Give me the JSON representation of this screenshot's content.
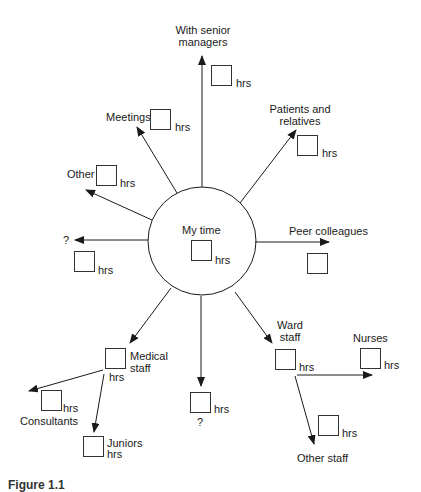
{
  "diagram": {
    "center": {
      "label": "My time",
      "unit": "hrs"
    },
    "unit": "hrs",
    "question_mark": "?",
    "branches": {
      "senior_managers": {
        "label_line1": "With senior",
        "label_line2": "managers",
        "unit": "hrs"
      },
      "meetings": {
        "label": "Meetings",
        "unit": "hrs"
      },
      "patients": {
        "label_line1": "Patients and",
        "label_line2": "relatives",
        "unit": "hrs"
      },
      "other": {
        "label": "Other",
        "unit": "hrs"
      },
      "unknown_left": {
        "label": "?",
        "unit": "hrs"
      },
      "peer": {
        "label": "Peer colleagues"
      },
      "medical_staff": {
        "label_line1": "Medical",
        "label_line2": "staff",
        "unit": "hrs"
      },
      "consultants": {
        "label": "Consultants",
        "unit": "hrs"
      },
      "juniors": {
        "label": "Juniors",
        "unit": "hrs"
      },
      "unknown_down": {
        "label": "?",
        "unit": "hrs"
      },
      "ward_staff": {
        "label_line1": "Ward",
        "label_line2": "staff",
        "unit": "hrs"
      },
      "nurses": {
        "label": "Nurses",
        "unit": "hrs"
      },
      "other_staff": {
        "label": "Other staff",
        "unit": "hrs"
      }
    },
    "colors": {
      "line": "#1a1a1a",
      "background": "#ffffff"
    }
  },
  "caption": {
    "text": "Figure 1.1"
  }
}
